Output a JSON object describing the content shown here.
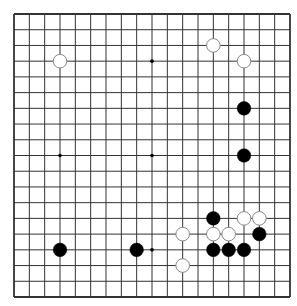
{
  "board": {
    "size": 19,
    "colors": {
      "background": "#ffffff",
      "line": "#333333",
      "black_stone": "#000000",
      "white_stone": "#ffffff",
      "white_stone_border": "#888888",
      "star_point": "#000000"
    },
    "star_points": [
      [
        3,
        3
      ],
      [
        9,
        3
      ],
      [
        15,
        3
      ],
      [
        3,
        9
      ],
      [
        9,
        9
      ],
      [
        15,
        9
      ],
      [
        3,
        15
      ],
      [
        9,
        15
      ],
      [
        15,
        15
      ]
    ],
    "stones": [
      {
        "color": "white",
        "col": 3,
        "row": 3
      },
      {
        "color": "white",
        "col": 13,
        "row": 2
      },
      {
        "color": "white",
        "col": 15,
        "row": 3
      },
      {
        "color": "black",
        "col": 15,
        "row": 6
      },
      {
        "color": "black",
        "col": 15,
        "row": 9
      },
      {
        "color": "black",
        "col": 13,
        "row": 13
      },
      {
        "color": "white",
        "col": 15,
        "row": 13
      },
      {
        "color": "white",
        "col": 16,
        "row": 13
      },
      {
        "color": "white",
        "col": 11,
        "row": 14
      },
      {
        "color": "white",
        "col": 13,
        "row": 14
      },
      {
        "color": "white",
        "col": 14,
        "row": 14
      },
      {
        "color": "black",
        "col": 16,
        "row": 14
      },
      {
        "color": "black",
        "col": 3,
        "row": 15
      },
      {
        "color": "black",
        "col": 8,
        "row": 15
      },
      {
        "color": "black",
        "col": 13,
        "row": 15
      },
      {
        "color": "black",
        "col": 14,
        "row": 15
      },
      {
        "color": "black",
        "col": 15,
        "row": 15
      },
      {
        "color": "white",
        "col": 11,
        "row": 16
      }
    ]
  }
}
